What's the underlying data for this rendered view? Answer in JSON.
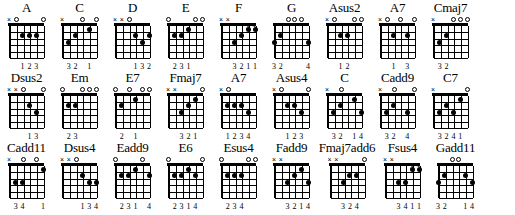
{
  "document": {
    "type": "guitar-chord-chart",
    "title": "",
    "rows": 3,
    "chords_per_row": 9,
    "strings": 6,
    "frets": 5,
    "colors": {
      "ink": "#000000",
      "paper": "#ffffff"
    }
  },
  "chart_data": {
    "type": "table",
    "columns": [
      "chord name",
      "string markers",
      "finger dots",
      "fingering numbers"
    ],
    "rows": [
      {
        "name": "A",
        "markers": [
          "x",
          "o",
          "",
          "",
          "",
          "o"
        ],
        "dots": [
          {
            "string": 4,
            "fret": 2
          },
          {
            "string": 3,
            "fret": 2
          },
          {
            "string": 2,
            "fret": 2
          }
        ],
        "barres": [],
        "fingering": [
          "",
          "",
          "1",
          "2",
          "3",
          ""
        ],
        "fingering_text": "123"
      },
      {
        "name": "C",
        "markers": [
          "x",
          "",
          "",
          "o",
          "",
          "o"
        ],
        "dots": [
          {
            "string": 5,
            "fret": 3
          },
          {
            "string": 4,
            "fret": 2
          },
          {
            "string": 2,
            "fret": 1
          }
        ],
        "barres": [],
        "fingering": [
          "",
          "3",
          "2",
          "",
          "1",
          ""
        ],
        "fingering_text": "32 1"
      },
      {
        "name": "D",
        "markers": [
          "x",
          "x",
          "o",
          "",
          "",
          ""
        ],
        "dots": [
          {
            "string": 3,
            "fret": 2
          },
          {
            "string": 2,
            "fret": 3
          },
          {
            "string": 1,
            "fret": 2
          }
        ],
        "barres": [],
        "fingering": [
          "",
          "",
          "",
          "1",
          "3",
          "2"
        ],
        "fingering_text": "132"
      },
      {
        "name": "E",
        "markers": [
          "o",
          "",
          "",
          "",
          "o",
          "o"
        ],
        "dots": [
          {
            "string": 5,
            "fret": 2
          },
          {
            "string": 4,
            "fret": 2
          },
          {
            "string": 3,
            "fret": 1
          }
        ],
        "barres": [],
        "fingering": [
          "",
          "2",
          "3",
          "1",
          "",
          ""
        ],
        "fingering_text": "231"
      },
      {
        "name": "F",
        "markers": [
          "x",
          "x",
          "",
          "",
          "",
          ""
        ],
        "dots": [
          {
            "string": 4,
            "fret": 3
          },
          {
            "string": 3,
            "fret": 2
          },
          {
            "string": 2,
            "fret": 1
          },
          {
            "string": 1,
            "fret": 1
          }
        ],
        "barres": [
          {
            "fret": 1,
            "from": 2,
            "to": 1
          }
        ],
        "fingering": [
          "",
          "",
          "3",
          "2",
          "1",
          "1"
        ],
        "fingering_text": "3211"
      },
      {
        "name": "G",
        "markers": [
          "",
          "",
          "o",
          "o",
          "o",
          ""
        ],
        "dots": [
          {
            "string": 6,
            "fret": 3
          },
          {
            "string": 5,
            "fret": 2
          },
          {
            "string": 1,
            "fret": 3
          }
        ],
        "barres": [],
        "fingering": [
          "3",
          "2",
          "",
          "",
          "",
          "4"
        ],
        "fingering_text": "32      4"
      },
      {
        "name": "Asus2",
        "markers": [
          "x",
          "o",
          "",
          "",
          "o",
          "o"
        ],
        "dots": [
          {
            "string": 4,
            "fret": 2
          },
          {
            "string": 3,
            "fret": 2
          }
        ],
        "barres": [],
        "fingering": [
          "",
          "",
          "1",
          "2",
          "",
          ""
        ],
        "fingering_text": "12"
      },
      {
        "name": "A7",
        "markers": [
          "x",
          "o",
          "",
          "o",
          "",
          "o"
        ],
        "dots": [
          {
            "string": 4,
            "fret": 2
          },
          {
            "string": 2,
            "fret": 2
          }
        ],
        "barres": [],
        "fingering": [
          "",
          "",
          "1",
          "",
          "3",
          ""
        ],
        "fingering_text": "1  3"
      },
      {
        "name": "Cmaj7",
        "markers": [
          "x",
          "",
          "",
          "o",
          "o",
          "o"
        ],
        "dots": [
          {
            "string": 5,
            "fret": 3
          },
          {
            "string": 4,
            "fret": 2
          }
        ],
        "barres": [],
        "fingering": [
          "",
          "3",
          "2",
          "",
          "",
          ""
        ],
        "fingering_text": "32"
      },
      {
        "name": "Dsus2",
        "markers": [
          "x",
          "x",
          "o",
          "",
          "",
          "o"
        ],
        "dots": [
          {
            "string": 3,
            "fret": 2
          },
          {
            "string": 2,
            "fret": 3
          }
        ],
        "barres": [],
        "fingering": [
          "",
          "",
          "",
          "1",
          "3",
          ""
        ],
        "fingering_text": "13"
      },
      {
        "name": "Em",
        "markers": [
          "o",
          "",
          "",
          "o",
          "o",
          "o"
        ],
        "dots": [
          {
            "string": 5,
            "fret": 2
          },
          {
            "string": 4,
            "fret": 2
          }
        ],
        "barres": [],
        "fingering": [
          "",
          "2",
          "3",
          "",
          "",
          ""
        ],
        "fingering_text": "23"
      },
      {
        "name": "E7",
        "markers": [
          "o",
          "",
          "o",
          "",
          "o",
          "o"
        ],
        "dots": [
          {
            "string": 5,
            "fret": 2
          },
          {
            "string": 3,
            "fret": 1
          }
        ],
        "barres": [],
        "fingering": [
          "",
          "2",
          "",
          "1",
          "",
          ""
        ],
        "fingering_text": "2  1"
      },
      {
        "name": "Fmaj7",
        "markers": [
          "x",
          "x",
          "",
          "",
          "",
          "o"
        ],
        "dots": [
          {
            "string": 4,
            "fret": 3
          },
          {
            "string": 3,
            "fret": 2
          },
          {
            "string": 2,
            "fret": 1
          }
        ],
        "barres": [],
        "fingering": [
          "",
          "",
          "3",
          "2",
          "1",
          ""
        ],
        "fingering_text": "321"
      },
      {
        "name": "A7",
        "markers": [
          "x",
          "o",
          "",
          "",
          "",
          ""
        ],
        "dots": [
          {
            "string": 5,
            "fret": 2
          },
          {
            "string": 4,
            "fret": 2
          },
          {
            "string": 3,
            "fret": 2
          },
          {
            "string": 2,
            "fret": 3
          }
        ],
        "barres": [],
        "fingering": [
          "",
          "1",
          "2",
          "3",
          "4",
          ""
        ],
        "fingering_text": "1234"
      },
      {
        "name": "Asus4",
        "markers": [
          "x",
          "o",
          "",
          "",
          "",
          "o"
        ],
        "dots": [
          {
            "string": 4,
            "fret": 2
          },
          {
            "string": 3,
            "fret": 2
          },
          {
            "string": 2,
            "fret": 3
          }
        ],
        "barres": [],
        "fingering": [
          "",
          "",
          "1",
          "2",
          "3",
          ""
        ],
        "fingering_text": "123"
      },
      {
        "name": "C",
        "markers": [
          "x",
          "",
          "o",
          "",
          "",
          ""
        ],
        "dots": [
          {
            "string": 5,
            "fret": 3
          },
          {
            "string": 4,
            "fret": 2
          },
          {
            "string": 2,
            "fret": 1
          },
          {
            "string": 1,
            "fret": 3
          }
        ],
        "barres": [],
        "fingering": [
          "",
          "3",
          "2",
          "",
          "1",
          "4"
        ],
        "fingering_text": "32  14"
      },
      {
        "name": "Cadd9",
        "markers": [
          "x",
          "",
          "o",
          "",
          "",
          "o"
        ],
        "dots": [
          {
            "string": 5,
            "fret": 3
          },
          {
            "string": 4,
            "fret": 2
          },
          {
            "string": 2,
            "fret": 3
          }
        ],
        "barres": [],
        "fingering": [
          "",
          "3",
          "2",
          "",
          "4",
          ""
        ],
        "fingering_text": "32   4"
      },
      {
        "name": "C7",
        "markers": [
          "x",
          "",
          "",
          "",
          "",
          "o"
        ],
        "dots": [
          {
            "string": 5,
            "fret": 3
          },
          {
            "string": 4,
            "fret": 2
          },
          {
            "string": 3,
            "fret": 3
          },
          {
            "string": 2,
            "fret": 1
          }
        ],
        "barres": [],
        "fingering": [
          "",
          "3",
          "2",
          "4",
          "1",
          ""
        ],
        "fingering_text": "3241"
      },
      {
        "name": "Cadd11",
        "markers": [
          "x",
          "",
          "o",
          "",
          "o",
          ""
        ],
        "dots": [
          {
            "string": 5,
            "fret": 3
          },
          {
            "string": 4,
            "fret": 3
          },
          {
            "string": 1,
            "fret": 1
          }
        ],
        "barres": [],
        "fingering": [
          "",
          "3",
          "4",
          "",
          "",
          "1"
        ],
        "fingering_text": "34   1"
      },
      {
        "name": "Dsus4",
        "markers": [
          "x",
          "x",
          "o",
          "",
          "",
          ""
        ],
        "dots": [
          {
            "string": 3,
            "fret": 2
          },
          {
            "string": 2,
            "fret": 3
          },
          {
            "string": 1,
            "fret": 3
          }
        ],
        "barres": [],
        "fingering": [
          "",
          "",
          "",
          "1",
          "3",
          "4"
        ],
        "fingering_text": "134"
      },
      {
        "name": "Eadd9",
        "markers": [
          "o",
          "",
          "",
          "",
          "o",
          ""
        ],
        "dots": [
          {
            "string": 5,
            "fret": 2
          },
          {
            "string": 4,
            "fret": 2
          },
          {
            "string": 3,
            "fret": 1
          },
          {
            "string": 1,
            "fret": 2
          }
        ],
        "barres": [],
        "fingering": [
          "",
          "2",
          "3",
          "1",
          "",
          "4"
        ],
        "fingering_text": "231  4"
      },
      {
        "name": "E6",
        "markers": [
          "o",
          "",
          "",
          "",
          "",
          "o"
        ],
        "dots": [
          {
            "string": 5,
            "fret": 2
          },
          {
            "string": 4,
            "fret": 2
          },
          {
            "string": 3,
            "fret": 1
          },
          {
            "string": 2,
            "fret": 2
          }
        ],
        "barres": [],
        "fingering": [
          "",
          "2",
          "3",
          "1",
          "4",
          ""
        ],
        "fingering_text": "2314"
      },
      {
        "name": "Esus4",
        "markers": [
          "o",
          "",
          "",
          "",
          "o",
          "o"
        ],
        "dots": [
          {
            "string": 5,
            "fret": 2
          },
          {
            "string": 4,
            "fret": 2
          },
          {
            "string": 3,
            "fret": 2
          }
        ],
        "barres": [],
        "fingering": [
          "",
          "2",
          "3",
          "4",
          "",
          ""
        ],
        "fingering_text": "234"
      },
      {
        "name": "Fadd9",
        "markers": [
          "x",
          "x",
          "",
          "",
          "",
          ""
        ],
        "dots": [
          {
            "string": 4,
            "fret": 3
          },
          {
            "string": 3,
            "fret": 2
          },
          {
            "string": 2,
            "fret": 1
          },
          {
            "string": 1,
            "fret": 3
          }
        ],
        "barres": [],
        "fingering": [
          "",
          "",
          "3",
          "2",
          "1",
          "4"
        ],
        "fingering_text": "3214"
      },
      {
        "name": "Fmaj7add6",
        "markers": [
          "x",
          "x",
          "",
          "",
          "",
          "o"
        ],
        "dots": [
          {
            "string": 4,
            "fret": 3
          },
          {
            "string": 3,
            "fret": 2
          },
          {
            "string": 2,
            "fret": 2
          }
        ],
        "barres": [],
        "fingering": [
          "",
          "",
          "3",
          "2",
          "4",
          ""
        ],
        "fingering_text": "324"
      },
      {
        "name": "Fsus4",
        "markers": [
          "x",
          "x",
          "",
          "",
          "",
          ""
        ],
        "dots": [
          {
            "string": 4,
            "fret": 3
          },
          {
            "string": 3,
            "fret": 3
          },
          {
            "string": 2,
            "fret": 1
          },
          {
            "string": 1,
            "fret": 1
          }
        ],
        "barres": [
          {
            "fret": 1,
            "from": 2,
            "to": 1
          }
        ],
        "fingering": [
          "",
          "",
          "3",
          "4",
          "1",
          "1"
        ],
        "fingering_text": "3411"
      },
      {
        "name": "Gadd11",
        "markers": [
          "",
          "",
          "o",
          "o",
          "",
          ""
        ],
        "dots": [
          {
            "string": 6,
            "fret": 3
          },
          {
            "string": 5,
            "fret": 2
          },
          {
            "string": 2,
            "fret": 2
          },
          {
            "string": 1,
            "fret": 3
          }
        ],
        "barres": [],
        "fingering": [
          "3",
          "2",
          "",
          "",
          "1",
          "4"
        ],
        "fingering_text": "32    14"
      }
    ]
  }
}
